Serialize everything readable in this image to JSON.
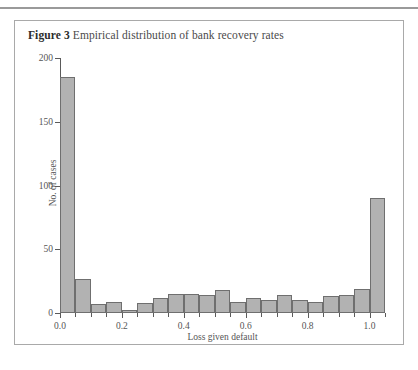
{
  "page": {
    "has_top_rule": true
  },
  "figure": {
    "label": "Figure 3",
    "title": "Empirical distribution of bank recovery rates"
  },
  "chart_data": {
    "type": "bar",
    "title": "Empirical distribution of bank recovery rates",
    "xlabel": "Loss given default",
    "ylabel": "No. of cases",
    "xlim": [
      0.0,
      1.05
    ],
    "ylim": [
      0,
      200
    ],
    "grid": false,
    "legend": null,
    "bin_width": 0.05,
    "x_major_ticks": [
      0.0,
      0.2,
      0.4,
      0.6,
      0.8,
      1.0
    ],
    "x_major_tick_labels": [
      "0.0",
      "0.2",
      "0.4",
      "0.6",
      "0.8",
      "1.0"
    ],
    "x_minor_ticks": [
      0.05,
      0.1,
      0.15,
      0.25,
      0.3,
      0.35,
      0.45,
      0.5,
      0.55,
      0.65,
      0.7,
      0.75,
      0.85,
      0.9,
      0.95,
      1.05
    ],
    "y_ticks": [
      0,
      50,
      100,
      150,
      200
    ],
    "y_tick_labels": [
      "0",
      "50",
      "100",
      "150",
      "200"
    ],
    "bin_edges": [
      0.0,
      0.05,
      0.1,
      0.15,
      0.2,
      0.25,
      0.3,
      0.35,
      0.4,
      0.45,
      0.5,
      0.55,
      0.6,
      0.65,
      0.7,
      0.75,
      0.8,
      0.85,
      0.9,
      0.95,
      1.0,
      1.05
    ],
    "categories": [
      "0.00-0.05",
      "0.05-0.10",
      "0.10-0.15",
      "0.15-0.20",
      "0.20-0.25",
      "0.25-0.30",
      "0.30-0.35",
      "0.35-0.40",
      "0.40-0.45",
      "0.45-0.50",
      "0.50-0.55",
      "0.55-0.60",
      "0.60-0.65",
      "0.65-0.70",
      "0.70-0.75",
      "0.75-0.80",
      "0.80-0.85",
      "0.85-0.90",
      "0.90-0.95",
      "0.95-1.00",
      "1.00-1.05"
    ],
    "values": [
      185,
      27,
      7,
      9,
      2,
      8,
      12,
      15,
      15,
      14,
      18,
      9,
      12,
      10,
      14,
      10,
      9,
      13,
      14,
      19,
      90
    ],
    "bar_fill_color": "#b2b2b2",
    "bar_edge_color": "#6f6f6f",
    "axis_color": "#5a5a5a"
  }
}
